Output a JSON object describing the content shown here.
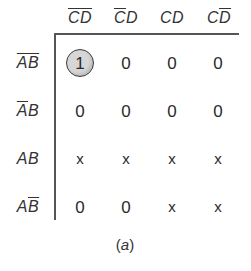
{
  "diagram": {
    "type": "karnaugh-map",
    "variables": [
      "A",
      "B",
      "C",
      "D"
    ],
    "columns": [
      {
        "label_parts": [
          {
            "t": "C",
            "bar": true
          },
          {
            "t": "D",
            "bar": true
          }
        ],
        "text": "C̄D̄"
      },
      {
        "label_parts": [
          {
            "t": "C",
            "bar": true
          },
          {
            "t": "D",
            "bar": false
          }
        ],
        "text": "C̄D"
      },
      {
        "label_parts": [
          {
            "t": "C",
            "bar": false
          },
          {
            "t": "D",
            "bar": false
          }
        ],
        "text": "CD"
      },
      {
        "label_parts": [
          {
            "t": "C",
            "bar": false
          },
          {
            "t": "D",
            "bar": true
          }
        ],
        "text": "CD̄"
      }
    ],
    "rows": [
      {
        "label_parts": [
          {
            "t": "A",
            "bar": true
          },
          {
            "t": "B",
            "bar": true
          }
        ],
        "text": "ĀB̄",
        "cells": [
          "1",
          "0",
          "0",
          "0"
        ]
      },
      {
        "label_parts": [
          {
            "t": "A",
            "bar": true
          },
          {
            "t": "B",
            "bar": false
          }
        ],
        "text": "ĀB",
        "cells": [
          "0",
          "0",
          "0",
          "0"
        ]
      },
      {
        "label_parts": [
          {
            "t": "A",
            "bar": false
          },
          {
            "t": "B",
            "bar": false
          }
        ],
        "text": "AB",
        "cells": [
          "x",
          "x",
          "x",
          "x"
        ]
      },
      {
        "label_parts": [
          {
            "t": "A",
            "bar": false
          },
          {
            "t": "B",
            "bar": true
          }
        ],
        "text": "AB̄",
        "cells": [
          "0",
          "0",
          "x",
          "x"
        ]
      }
    ],
    "circled_cells": [
      {
        "row": 0,
        "col": 0
      }
    ],
    "caption": {
      "open": "(",
      "letter": "a",
      "close": ")"
    }
  }
}
